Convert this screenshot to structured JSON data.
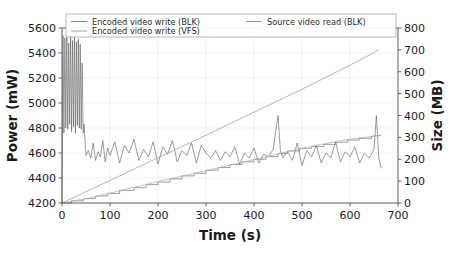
{
  "chart_data": {
    "type": "line",
    "title": "",
    "xlabel": "Time (s)",
    "ylabel": "Power (mW)",
    "ylabel_right": "Size (MB)",
    "xlim": [
      0,
      700
    ],
    "ylim": [
      4200,
      5600
    ],
    "ylim_right": [
      0,
      800
    ],
    "xticks": [
      0,
      100,
      200,
      300,
      400,
      500,
      600,
      700
    ],
    "yticks": [
      4200,
      4400,
      4600,
      4800,
      5000,
      5200,
      5400,
      5600
    ],
    "yticks_right": [
      0,
      100,
      200,
      300,
      400,
      500,
      600,
      700,
      800
    ],
    "grid": true,
    "legend_position": "upper-center-split",
    "legend": [
      {
        "label": "Encoded video write (BLK)",
        "color": "#6f6f6f",
        "column": 0,
        "row": 0
      },
      {
        "label": "Encoded video write (VFS)",
        "color": "#9a9a9a",
        "column": 0,
        "row": 1
      },
      {
        "label": "Source video read (BLK)",
        "color": "#8a8a8a",
        "column": 1,
        "row": 0
      }
    ],
    "series": [
      {
        "name": "Power (mW)",
        "axis": "left",
        "color": "#5a5a5a",
        "description": "Noisy power trace: high-amplitude oscillation 5550-4750 mW during 0-42 s, then settles to ~4450-4700 mW band with spikes, trending slightly upward toward end.",
        "x": [
          0,
          2,
          4,
          6,
          8,
          10,
          12,
          14,
          16,
          18,
          20,
          22,
          24,
          26,
          28,
          30,
          32,
          34,
          36,
          38,
          40,
          42,
          44,
          46,
          48,
          50,
          55,
          60,
          65,
          70,
          75,
          80,
          85,
          90,
          95,
          100,
          110,
          120,
          130,
          140,
          150,
          160,
          170,
          180,
          190,
          200,
          210,
          220,
          230,
          240,
          250,
          260,
          270,
          280,
          290,
          300,
          310,
          320,
          330,
          340,
          350,
          360,
          370,
          380,
          390,
          400,
          410,
          420,
          430,
          440,
          450,
          455,
          460,
          470,
          480,
          490,
          500,
          510,
          520,
          530,
          540,
          550,
          560,
          570,
          580,
          590,
          600,
          610,
          620,
          630,
          640,
          650,
          655,
          660,
          665
        ],
        "y": [
          4210,
          5540,
          4760,
          5520,
          4800,
          5555,
          4790,
          5480,
          4830,
          5545,
          4770,
          5500,
          4810,
          5530,
          4760,
          5490,
          4820,
          5510,
          4800,
          5470,
          4790,
          5320,
          4760,
          4830,
          4700,
          4580,
          4620,
          4560,
          4680,
          4540,
          4610,
          4570,
          4700,
          4530,
          4640,
          4580,
          4690,
          4520,
          4660,
          4600,
          4710,
          4540,
          4630,
          4570,
          4690,
          4510,
          4650,
          4590,
          4700,
          4530,
          4620,
          4580,
          4680,
          4520,
          4660,
          4600,
          4560,
          4620,
          4540,
          4610,
          4570,
          4650,
          4510,
          4600,
          4560,
          4640,
          4520,
          4590,
          4570,
          4630,
          4900,
          4620,
          4560,
          4610,
          4540,
          4680,
          4500,
          4620,
          4570,
          4660,
          4520,
          4600,
          4560,
          4690,
          4530,
          4610,
          4570,
          4650,
          4520,
          4600,
          4560,
          4630,
          4900,
          4560,
          4480
        ]
      },
      {
        "name": "Source video read (BLK)",
        "axis": "right",
        "color": "#9e9e9e",
        "description": "Straight ramp from 0 MB at 0 s to about 700 MB at 660 s.",
        "x": [
          0,
          100,
          200,
          300,
          400,
          500,
          600,
          660
        ],
        "y": [
          0,
          103,
          207,
          310,
          415,
          520,
          630,
          700
        ]
      },
      {
        "name": "Encoded video write (BLK)",
        "axis": "right",
        "color": "#7d7d7d",
        "description": "Stepped staircase from 0 MB to about 310 MB at 665 s, steps of roughly 10-20 MB.",
        "x": [
          0,
          20,
          20,
          45,
          45,
          70,
          70,
          95,
          95,
          120,
          120,
          150,
          150,
          175,
          175,
          200,
          200,
          225,
          225,
          250,
          250,
          275,
          275,
          300,
          300,
          325,
          325,
          350,
          350,
          375,
          375,
          400,
          400,
          425,
          425,
          450,
          450,
          470,
          470,
          495,
          495,
          520,
          520,
          545,
          545,
          570,
          570,
          595,
          595,
          620,
          620,
          645,
          645,
          665
        ],
        "y": [
          0,
          0,
          10,
          10,
          20,
          20,
          32,
          32,
          44,
          44,
          58,
          58,
          70,
          70,
          84,
          84,
          96,
          96,
          110,
          110,
          124,
          124,
          136,
          136,
          150,
          150,
          162,
          162,
          176,
          176,
          188,
          188,
          200,
          200,
          212,
          212,
          226,
          226,
          238,
          238,
          250,
          250,
          258,
          258,
          268,
          268,
          278,
          278,
          288,
          288,
          296,
          296,
          305,
          310
        ]
      },
      {
        "name": "Encoded video write (VFS)",
        "axis": "right",
        "color": "#b0b0b0",
        "description": "Nearly coincident with the BLK write staircase, slightly smoother.",
        "x": [
          0,
          60,
          120,
          180,
          240,
          300,
          360,
          420,
          480,
          540,
          600,
          660
        ],
        "y": [
          0,
          24,
          56,
          88,
          118,
          148,
          178,
          208,
          240,
          268,
          292,
          308
        ]
      }
    ]
  },
  "axes": {
    "left_label": "Power (mW)",
    "right_label": "Size (MB)",
    "bottom_label": "Time (s)"
  }
}
